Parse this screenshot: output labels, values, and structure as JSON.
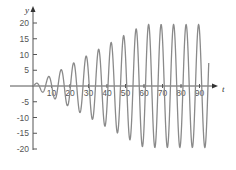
{
  "chart_data": {
    "type": "line",
    "title": "",
    "xlabel": "t",
    "ylabel": "y",
    "xlim": [
      0,
      97
    ],
    "ylim": [
      -23,
      23
    ],
    "grid": false,
    "legend": null,
    "x_ticks": [
      10,
      20,
      30,
      40,
      50,
      60,
      70,
      80,
      90
    ],
    "y_ticks": [
      20,
      15,
      10,
      5,
      -5,
      -10,
      -15,
      -20
    ],
    "series": [
      {
        "name": "y(t)",
        "description": "oscillation with linearly growing amplitude saturating near 19.5",
        "angular_frequency": 0.93,
        "amplitude_slope": 0.32,
        "amplitude_max": 19.5,
        "t_range": [
          0,
          95
        ],
        "peaks": [
          {
            "t": 3,
            "y": 1
          },
          {
            "t": 10,
            "y": 3
          },
          {
            "t": 16,
            "y": 5
          },
          {
            "t": 23,
            "y": 7
          },
          {
            "t": 29,
            "y": 9
          },
          {
            "t": 36,
            "y": 11
          },
          {
            "t": 42,
            "y": 12.5
          },
          {
            "t": 49,
            "y": 14.5
          },
          {
            "t": 55,
            "y": 16.5
          },
          {
            "t": 61,
            "y": 18
          },
          {
            "t": 68,
            "y": 19.5
          },
          {
            "t": 74,
            "y": 19.5
          },
          {
            "t": 81,
            "y": 19.5
          },
          {
            "t": 87,
            "y": 19.5
          },
          {
            "t": 93,
            "y": 19.5
          }
        ]
      }
    ],
    "colors": {
      "line": "#8a8a8a",
      "axis": "#555555",
      "text": "#555555"
    }
  }
}
